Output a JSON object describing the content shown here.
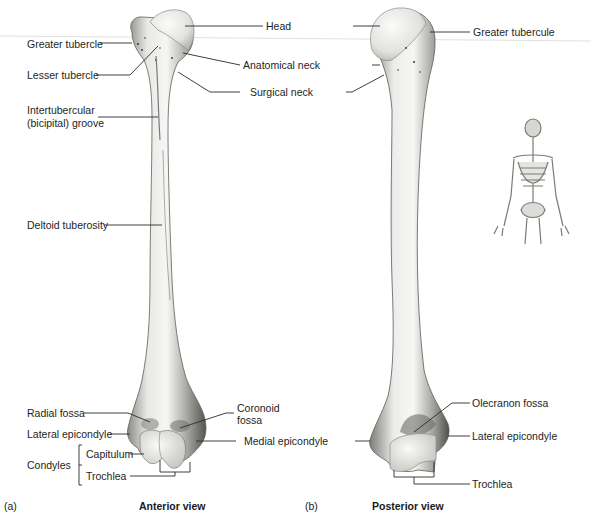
{
  "figure": {
    "panels": [
      {
        "id": "a",
        "panel_label": "(a)",
        "caption": "Anterior view",
        "labels": {
          "head": "Head",
          "greater_tubercle": "Greater tubercle",
          "lesser_tubercle": "Lesser tubercle",
          "anatomical_neck": "Anatomical neck",
          "surgical_neck": "Surgical neck",
          "intertubercular_line1": "Intertubercular",
          "intertubercular_line2": "(bicipital) groove",
          "deltoid_tuberosity": "Deltoid tuberosity",
          "radial_fossa": "Radial fossa",
          "coronoid_line1": "Coronoid",
          "coronoid_line2": "fossa",
          "lateral_epicondyle": "Lateral epicondyle",
          "medial_epicondyle": "Medial epicondyle",
          "condyles": "Condyles",
          "capitulum": "Capitulum",
          "trochlea": "Trochlea"
        }
      },
      {
        "id": "b",
        "panel_label": "(b)",
        "caption": "Posterior view",
        "labels": {
          "greater_tubercule": "Greater tubercule",
          "olecranon_fossa": "Olecranon fossa",
          "lateral_epicondyle": "Lateral epicondyle",
          "trochlea": "Trochlea"
        }
      }
    ],
    "inset": {
      "name": "full-skeleton-locator"
    },
    "colors": {
      "bone_light": "#f2f2f0",
      "bone_mid": "#c9c9c5",
      "bone_dark": "#6e6e6a",
      "leader": "#2a2a2a"
    }
  }
}
